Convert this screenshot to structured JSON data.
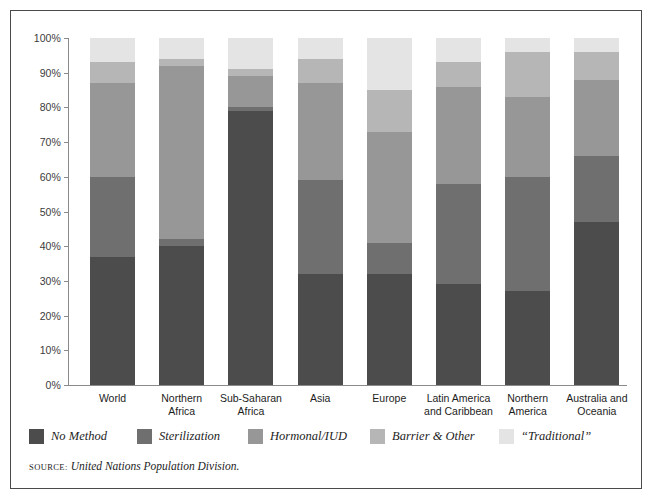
{
  "chart_data": {
    "type": "bar",
    "subtype": "stacked-bar-100",
    "title": "",
    "xlabel": "",
    "ylabel": "",
    "ylim": [
      0,
      100
    ],
    "grid": false,
    "legend_position": "bottom-left",
    "tick_labels": [
      "0%",
      "10%",
      "20%",
      "30%",
      "40%",
      "50%",
      "60%",
      "70%",
      "80%",
      "90%",
      "100%"
    ],
    "tick_values": [
      0,
      10,
      20,
      30,
      40,
      50,
      60,
      70,
      80,
      90,
      100
    ],
    "categories": [
      "World",
      "Northern\nAfrica",
      "Sub-Saharan\nAfrica",
      "Asia",
      "Europe",
      "Latin America\nand Caribbean",
      "Northern\nAmerica",
      "Australia and\nOceania"
    ],
    "series": [
      {
        "name": "No Method",
        "color": "#4c4c4c",
        "values": [
          37,
          40,
          79,
          32,
          32,
          29,
          27,
          47
        ]
      },
      {
        "name": "Sterilization",
        "color": "#6f6f6f",
        "values": [
          23,
          2,
          1,
          27,
          9,
          29,
          33,
          19
        ]
      },
      {
        "name": "Hormonal/IUD",
        "color": "#979797",
        "values": [
          27,
          50,
          9,
          28,
          32,
          28,
          23,
          22
        ]
      },
      {
        "name": "Barrier & Other",
        "color": "#b6b6b6",
        "values": [
          6,
          2,
          2,
          7,
          12,
          7,
          13,
          8
        ]
      },
      {
        "name": "“Traditional”",
        "color": "#e4e4e4",
        "values": [
          7,
          6,
          9,
          6,
          15,
          7,
          4,
          4
        ]
      }
    ]
  },
  "legend": {
    "items": [
      {
        "label": "No Method",
        "color": "#4c4c4c"
      },
      {
        "label": "Sterilization",
        "color": "#6f6f6f"
      },
      {
        "label": "Hormonal/IUD",
        "color": "#979797"
      },
      {
        "label": "Barrier & Other",
        "color": "#b6b6b6"
      },
      {
        "label": "“Traditional”",
        "color": "#e4e4e4"
      }
    ]
  },
  "source": {
    "label": "Source:",
    "text": "United Nations Population Division."
  }
}
